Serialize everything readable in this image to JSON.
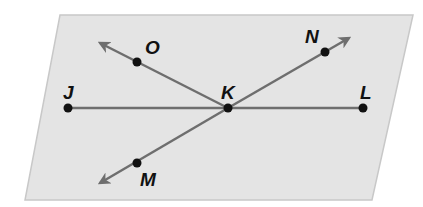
{
  "diagram": {
    "type": "geometry-plane",
    "colors": {
      "plane_fill": "#e4e4e4",
      "plane_edge": "#c8c8c8",
      "line": "#6e6e6e",
      "point": "#111111",
      "label": "#111111"
    },
    "plane": {
      "points": "60,15 413,15 372,200 25,200"
    },
    "points": [
      {
        "id": "J",
        "label": "J",
        "x": 68,
        "y": 108,
        "lx": 63,
        "ly": 99
      },
      {
        "id": "K",
        "label": "K",
        "x": 228,
        "y": 108,
        "lx": 221,
        "ly": 99
      },
      {
        "id": "L",
        "label": "L",
        "x": 363,
        "y": 108,
        "lx": 360,
        "ly": 99
      },
      {
        "id": "O",
        "label": "O",
        "x": 137,
        "y": 62,
        "lx": 145,
        "ly": 54
      },
      {
        "id": "N",
        "label": "N",
        "x": 325,
        "y": 52,
        "lx": 305,
        "ly": 43
      },
      {
        "id": "M",
        "label": "M",
        "x": 137,
        "y": 163,
        "lx": 140,
        "ly": 186
      }
    ],
    "segments": [
      {
        "id": "JL",
        "from": [
          68,
          108
        ],
        "to": [
          363,
          108
        ],
        "arrow_end": false
      }
    ],
    "rays": [
      {
        "id": "KO",
        "from": [
          228,
          108
        ],
        "to": [
          100,
          43
        ]
      },
      {
        "id": "KN",
        "from": [
          228,
          108
        ],
        "to": [
          349,
          38
        ]
      },
      {
        "id": "KM",
        "from": [
          228,
          108
        ],
        "to": [
          100,
          183
        ]
      }
    ]
  }
}
